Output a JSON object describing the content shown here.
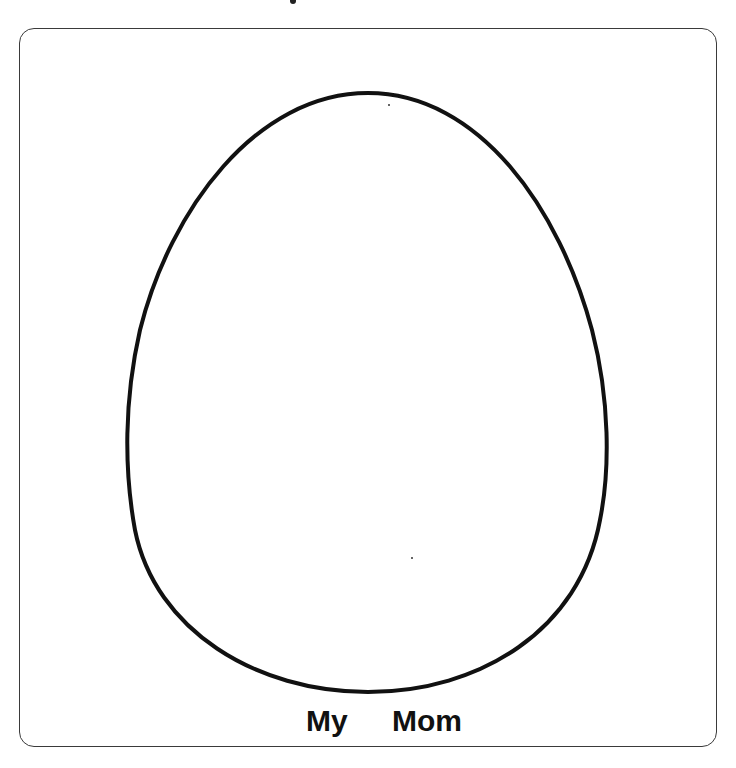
{
  "worksheet": {
    "caption_words": [
      "My",
      "Mom"
    ],
    "shape": "egg-outline",
    "colors": {
      "outline": "#111111",
      "frame": "#3a3a3a",
      "background": "#ffffff"
    }
  }
}
